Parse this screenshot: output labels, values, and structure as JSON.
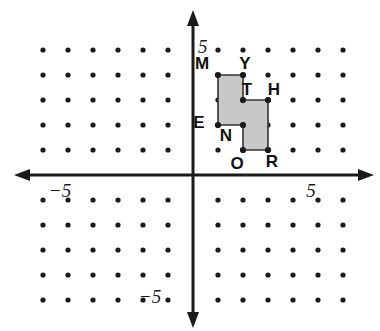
{
  "figure": {
    "background": "#ffffff",
    "dot_color": "#1a1a1a",
    "axis_color": "#1a1a1a",
    "polygon_fill": "#c8c8c8",
    "polygon_stroke": "#333333"
  },
  "chart_data": {
    "type": "scatter",
    "title": "",
    "xlabel": "",
    "ylabel": "",
    "xlim": [
      -6,
      6
    ],
    "ylim": [
      -5,
      5
    ],
    "grid": true,
    "legend": false,
    "origin_px": {
      "x": 193,
      "y": 175
    },
    "spacing_px": 25,
    "axis_ticks": {
      "x": [
        {
          "value": -5,
          "label": "−5"
        },
        {
          "value": 5,
          "label": "5"
        }
      ],
      "y": [
        {
          "value": 5,
          "label": "5"
        },
        {
          "value": -5,
          "label": "−5"
        }
      ]
    },
    "lattice": {
      "x_min": -6,
      "x_max": 6,
      "y_min": -5,
      "y_max": 5,
      "skip_axes": true
    },
    "polygon": {
      "name": "MYTHRONE",
      "closed": true,
      "vertices": [
        {
          "label": "M",
          "x": 1,
          "y": 4,
          "label_dx": -16,
          "label_dy": -6
        },
        {
          "label": "Y",
          "x": 2,
          "y": 4,
          "label_dx": 2,
          "label_dy": -6
        },
        {
          "label": "T",
          "x": 2,
          "y": 3,
          "label_dx": 4,
          "label_dy": -5
        },
        {
          "label": "H",
          "x": 3,
          "y": 3,
          "label_dx": 6,
          "label_dy": -5
        },
        {
          "label": "R",
          "x": 3,
          "y": 1,
          "label_dx": 4,
          "label_dy": 17
        },
        {
          "label": "O",
          "x": 2,
          "y": 1,
          "label_dx": -6,
          "label_dy": 19
        },
        {
          "label": "N",
          "x": 2,
          "y": 2,
          "label_dx": -17,
          "label_dy": 16
        },
        {
          "label": "E",
          "x": 1,
          "y": 2,
          "label_dx": -19,
          "label_dy": 3
        }
      ]
    },
    "axis_label_positions": {
      "x_neg_five": {
        "px": 60,
        "py": 197
      },
      "x_pos_five": {
        "px": 311,
        "py": 197
      },
      "y_pos_five": {
        "px": 198,
        "py": 53
      },
      "y_neg_five": {
        "px": 150,
        "py": 303
      }
    }
  }
}
